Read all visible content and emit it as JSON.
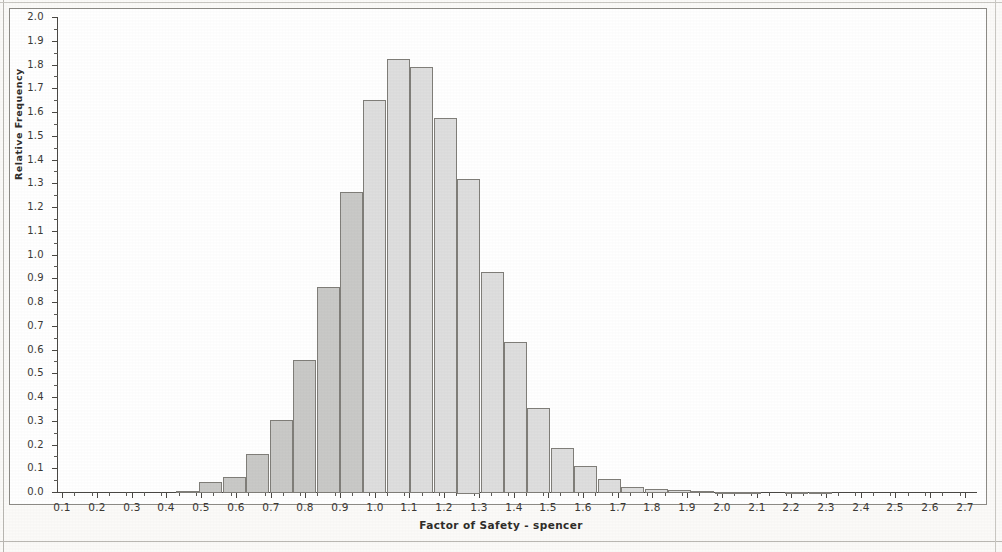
{
  "chart_data": {
    "type": "bar",
    "title": "",
    "subtitle": "",
    "xlabel": "Factor of Safety - spencer",
    "ylabel": "Relative Frequency",
    "xlim": [
      0.085,
      2.735
    ],
    "ylim": [
      0.0,
      2.0
    ],
    "grid": false,
    "legend": null,
    "x_tick_labels": [
      "0.1",
      "0.2",
      "0.3",
      "0.4",
      "0.5",
      "0.6",
      "0.7",
      "0.8",
      "0.9",
      "1.0",
      "1.1",
      "1.2",
      "1.3",
      "1.4",
      "1.5",
      "1.6",
      "1.7",
      "1.8",
      "1.9",
      "2.0",
      "2.1",
      "2.2",
      "2.3",
      "2.4",
      "2.5",
      "2.6",
      "2.7"
    ],
    "x_tick_values": [
      0.1,
      0.2,
      0.3,
      0.4,
      0.5,
      0.6,
      0.7,
      0.8,
      0.9,
      1.0,
      1.1,
      1.2,
      1.3,
      1.4,
      1.5,
      1.6,
      1.7,
      1.8,
      1.9,
      2.0,
      2.1,
      2.2,
      2.3,
      2.4,
      2.5,
      2.6,
      2.7
    ],
    "x_minor_step": 0.05,
    "y_tick_labels": [
      "0.0",
      "0.1",
      "0.2",
      "0.3",
      "0.4",
      "0.5",
      "0.6",
      "0.7",
      "0.8",
      "0.9",
      "1.0",
      "1.1",
      "1.2",
      "1.3",
      "1.4",
      "1.5",
      "1.6",
      "1.7",
      "1.8",
      "1.9",
      "2.0"
    ],
    "y_tick_values": [
      0.0,
      0.1,
      0.2,
      0.3,
      0.4,
      0.5,
      0.6,
      0.7,
      0.8,
      0.9,
      1.0,
      1.1,
      1.2,
      1.3,
      1.4,
      1.5,
      1.6,
      1.7,
      1.8,
      1.9,
      2.0
    ],
    "y_minor_step": 0.05,
    "bin_width": 0.0675,
    "bar_fill_dark": "#c9c9c7",
    "bar_fill_light": "#dedede",
    "bar_edge_color": "#807e79",
    "shade_split_x": 1.0,
    "bins": [
      {
        "x0": 0.2925,
        "x1": 0.36,
        "value": 0.0
      },
      {
        "x0": 0.36,
        "x1": 0.4275,
        "value": 0.0
      },
      {
        "x0": 0.4275,
        "x1": 0.495,
        "value": 0.006
      },
      {
        "x0": 0.495,
        "x1": 0.5625,
        "value": 0.042
      },
      {
        "x0": 0.5625,
        "x1": 0.63,
        "value": 0.065
      },
      {
        "x0": 0.63,
        "x1": 0.6975,
        "value": 0.16
      },
      {
        "x0": 0.6975,
        "x1": 0.765,
        "value": 0.305
      },
      {
        "x0": 0.765,
        "x1": 0.8325,
        "value": 0.555
      },
      {
        "x0": 0.8325,
        "x1": 0.9,
        "value": 0.865
      },
      {
        "x0": 0.9,
        "x1": 0.9675,
        "value": 1.265
      },
      {
        "x0": 0.9675,
        "x1": 1.035,
        "value": 1.65
      },
      {
        "x0": 1.035,
        "x1": 1.1025,
        "value": 1.825
      },
      {
        "x0": 1.1025,
        "x1": 1.17,
        "value": 1.79
      },
      {
        "x0": 1.17,
        "x1": 1.2375,
        "value": 1.575
      },
      {
        "x0": 1.2375,
        "x1": 1.305,
        "value": 1.32
      },
      {
        "x0": 1.305,
        "x1": 1.3725,
        "value": 0.925
      },
      {
        "x0": 1.3725,
        "x1": 1.44,
        "value": 0.63
      },
      {
        "x0": 1.44,
        "x1": 1.5075,
        "value": 0.355
      },
      {
        "x0": 1.5075,
        "x1": 1.575,
        "value": 0.185
      },
      {
        "x0": 1.575,
        "x1": 1.6425,
        "value": 0.11
      },
      {
        "x0": 1.6425,
        "x1": 1.71,
        "value": 0.055
      },
      {
        "x0": 1.71,
        "x1": 1.7775,
        "value": 0.022
      },
      {
        "x0": 1.7775,
        "x1": 1.845,
        "value": 0.012
      },
      {
        "x0": 1.845,
        "x1": 1.9125,
        "value": 0.007
      },
      {
        "x0": 1.9125,
        "x1": 1.98,
        "value": 0.004
      },
      {
        "x0": 1.98,
        "x1": 2.0475,
        "value": 0.002
      },
      {
        "x0": 2.0475,
        "x1": 2.115,
        "value": 0.002
      },
      {
        "x0": 2.115,
        "x1": 2.1825,
        "value": 0.0
      },
      {
        "x0": 2.1825,
        "x1": 2.25,
        "value": 0.002
      },
      {
        "x0": 2.25,
        "x1": 2.3175,
        "value": 0.002
      }
    ]
  }
}
